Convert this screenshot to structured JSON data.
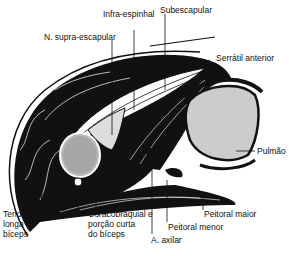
{
  "figure": {
    "labels": {
      "infra_espinhal": "Infra-espinhal",
      "subescapular": "Subescapular",
      "n_supra_escapular": "N. supra-escapular",
      "serratil_anterior": "Serrátil anterior",
      "pulmao": "Pulmão",
      "deltoide": "Deltóide",
      "tendao_line1": "Tendão da porção",
      "tendao_line2": "longa do",
      "tendao_line3": "bíceps",
      "coraco_line1": "Coracobraquial e",
      "coraco_line2": "porção curta",
      "coraco_line3": "do bíceps",
      "peitoral_maior": "Peitoral maior",
      "peitoral_menor": "Peitoral menor",
      "a_axilar": "A. axilar"
    },
    "colors": {
      "ink": "#111111",
      "background": "#ffffff"
    }
  }
}
